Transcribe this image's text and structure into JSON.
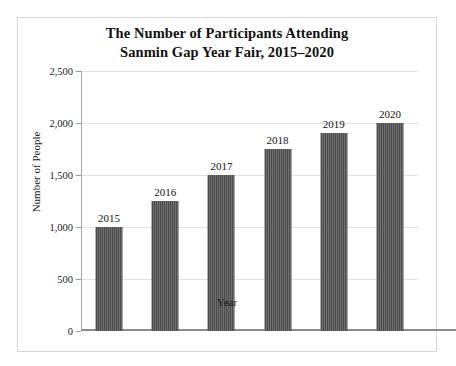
{
  "chart_data": {
    "type": "bar",
    "title": "The Number of Participants Attending Sanmin Gap Year Fair, 2015–2020",
    "title_lines": [
      "The Number of Participants Attending",
      "Sanmin Gap Year Fair, 2015–2020"
    ],
    "xlabel": "Year",
    "ylabel": "Number of People",
    "categories": [
      "2015",
      "2016",
      "2017",
      "2018",
      "2019",
      "2020"
    ],
    "values": [
      1000,
      1250,
      1500,
      1750,
      1900,
      2000
    ],
    "bar_labels": [
      "2015",
      "2016",
      "2017",
      "2018",
      "2019",
      "2020"
    ],
    "ylim": [
      0,
      2500
    ],
    "yticks": [
      0,
      500,
      1000,
      1500,
      2000,
      2500
    ],
    "ytick_labels": [
      "0",
      "500",
      "1,000",
      "1,500",
      "2,000",
      "2,500"
    ],
    "grid": true,
    "legend": null,
    "bar_color": "#565656",
    "grid_color": "#e3e3e3",
    "axis_color": "#8c8c8c",
    "frame_color": "#d6d6d6",
    "background": "#ffffff"
  }
}
